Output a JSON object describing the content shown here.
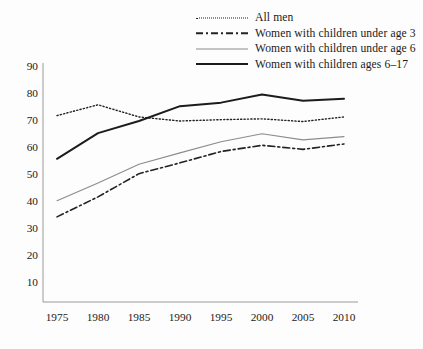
{
  "chart_data": {
    "type": "line",
    "title": "",
    "subtitle": "",
    "xlabel": "",
    "ylabel": "",
    "categories": [
      1975,
      1980,
      1985,
      1990,
      1995,
      2000,
      2005,
      2010
    ],
    "x": [
      1975,
      1980,
      1985,
      1990,
      1995,
      2000,
      2005,
      2010
    ],
    "xlim": [
      1975,
      2010
    ],
    "ylim": [
      10,
      90
    ],
    "ytick_labels": [
      "10",
      "20",
      "30",
      "40",
      "50",
      "60",
      "70",
      "80",
      "90"
    ],
    "yticks": [
      10,
      20,
      30,
      40,
      50,
      60,
      70,
      80,
      90
    ],
    "xtick_labels": [
      "1975",
      "1980",
      "1985",
      "1990",
      "1995",
      "2000",
      "2005",
      "2010"
    ],
    "grid": false,
    "legend_position": "top-right",
    "series": [
      {
        "name": "All men",
        "style": "dotted",
        "color": "#222222",
        "width": 1.4,
        "values": [
          72.0,
          76.0,
          71.5,
          70.0,
          70.5,
          70.8,
          69.8,
          71.5
        ]
      },
      {
        "name": "Women with children under age 3",
        "style": "dash-dot",
        "color": "#222222",
        "width": 1.6,
        "values": [
          34.5,
          41.9,
          50.5,
          54.5,
          58.7,
          61.0,
          59.5,
          61.5
        ]
      },
      {
        "name": "Women with children under age 6",
        "style": "solid-thin",
        "color": "#8c8c8c",
        "width": 1.1,
        "values": [
          40.5,
          47.0,
          54.0,
          58.2,
          62.3,
          65.3,
          63.0,
          64.2
        ]
      },
      {
        "name": "Women with children ages 6–17",
        "style": "solid-thick",
        "color": "#1c1c1c",
        "width": 2.0,
        "values": [
          56.0,
          65.5,
          70.0,
          75.5,
          76.8,
          79.8,
          77.5,
          78.2
        ]
      }
    ]
  },
  "legend": {
    "items": [
      {
        "label": "All men",
        "swatch": "dotted-line-swatch"
      },
      {
        "label": "Women with children under age 3",
        "swatch": "dash-dot-line-swatch"
      },
      {
        "label": "Women with children under age 6",
        "swatch": "thin-solid-line-swatch"
      },
      {
        "label": "Women with children ages 6–17",
        "swatch": "thick-solid-line-swatch"
      }
    ]
  },
  "axes": {
    "y_axis_color": "#9a9a9a",
    "x_axis_color": "#9a9a9a"
  }
}
